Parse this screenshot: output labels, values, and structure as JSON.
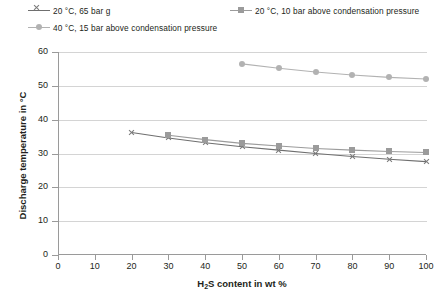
{
  "chart_data": {
    "type": "line",
    "title": "",
    "xlabel": "H2S content in wt %",
    "xlabel_parts": {
      "pre": "H",
      "sub": "2",
      "post": "S content in wt %"
    },
    "ylabel": "Discharge temperature in °C",
    "xlim": [
      0,
      100
    ],
    "ylim": [
      0,
      60
    ],
    "xticks": [
      0,
      10,
      20,
      30,
      40,
      50,
      60,
      70,
      80,
      90,
      100
    ],
    "yticks": [
      0,
      10,
      20,
      30,
      40,
      50,
      60
    ],
    "grid": "horizontal",
    "legend_position": "top",
    "series": [
      {
        "name": "20 °C, 65 bar g",
        "marker": "x-marker",
        "color": "#6f6f6f",
        "x": [
          20,
          30,
          40,
          50,
          60,
          70,
          80,
          90,
          100
        ],
        "values": [
          36.2,
          34.6,
          33.2,
          32.0,
          31.0,
          30.0,
          29.1,
          28.3,
          27.6
        ]
      },
      {
        "name": "20 °C, 10 bar above condensation pressure",
        "marker": "square-marker",
        "color": "#9b9b9b",
        "x": [
          30,
          40,
          50,
          60,
          70,
          80,
          90,
          100
        ],
        "values": [
          35.4,
          34.1,
          33.0,
          32.2,
          31.5,
          31.0,
          30.6,
          30.3
        ]
      },
      {
        "name": "40 °C, 15 bar above condensation pressure",
        "marker": "circle-marker",
        "color": "#b2b2b2",
        "x": [
          50,
          60,
          70,
          80,
          90,
          100
        ],
        "values": [
          56.5,
          55.2,
          54.1,
          53.2,
          52.5,
          52.0
        ]
      }
    ]
  }
}
